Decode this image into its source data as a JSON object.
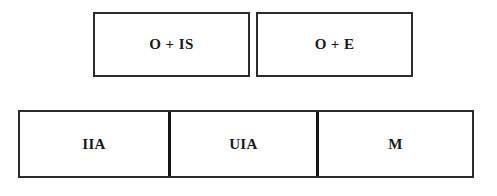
{
  "diagram": {
    "background_color": "#ffffff",
    "border_color": "#2b2b2b",
    "divider_color": "#141414",
    "text_color": "#1a1a1a",
    "top_row": {
      "boxes": [
        {
          "label": "O + IS"
        },
        {
          "label": "O + E"
        }
      ]
    },
    "bottom_row": {
      "cells": [
        {
          "label": "IIA"
        },
        {
          "label": "UIA"
        },
        {
          "label": "M"
        }
      ]
    }
  }
}
